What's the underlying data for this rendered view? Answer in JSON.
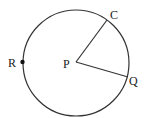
{
  "diagram": {
    "type": "circle-with-radii",
    "circle": {
      "cx": 76,
      "cy": 63,
      "r": 53,
      "stroke": "#333333"
    },
    "center": {
      "label": "P",
      "x": 76,
      "y": 62
    },
    "points": [
      {
        "label": "C",
        "x": 107,
        "y": 20
      },
      {
        "label": "Q",
        "x": 128,
        "y": 77
      },
      {
        "label": "R",
        "x": 23,
        "y": 62,
        "marked": true
      }
    ],
    "segments": [
      {
        "from": "P",
        "to": "C"
      },
      {
        "from": "P",
        "to": "Q"
      }
    ]
  },
  "labels": {
    "p": "P",
    "c": "C",
    "q": "Q",
    "r": "R"
  }
}
